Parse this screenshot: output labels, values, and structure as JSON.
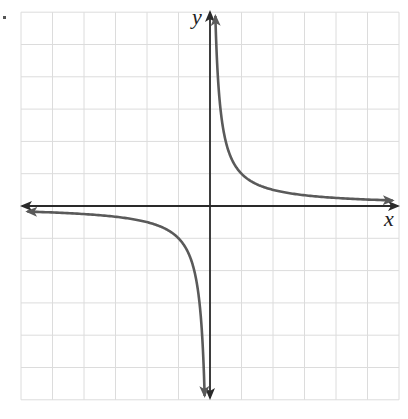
{
  "chart_data": {
    "type": "line",
    "title": "",
    "xlabel": "x",
    "ylabel": "y",
    "xlim": [
      -6,
      6
    ],
    "ylim": [
      -6,
      6
    ],
    "grid": true,
    "ticks_labeled": false,
    "legend": null,
    "series": [
      {
        "name": "y = k/x (k ≈ 1), first-quadrant branch",
        "equation": "y = 1/x",
        "x": [
          0.17,
          0.25,
          0.33,
          0.5,
          0.75,
          1,
          1.5,
          2,
          3,
          4,
          5,
          5.8
        ],
        "y": [
          5.8,
          4,
          3,
          2,
          1.33,
          1,
          0.67,
          0.5,
          0.33,
          0.25,
          0.2,
          0.17
        ]
      },
      {
        "name": "y = k/x (k ≈ 1), third-quadrant branch",
        "equation": "y = 1/x",
        "x": [
          -5.8,
          -5,
          -4,
          -3,
          -2,
          -1.5,
          -1,
          -0.75,
          -0.5,
          -0.33,
          -0.25,
          -0.17
        ],
        "y": [
          -0.17,
          -0.2,
          -0.25,
          -0.33,
          -0.5,
          -0.67,
          -1,
          -1.33,
          -2,
          -3,
          -4,
          -5.8
        ]
      }
    ],
    "asymptotes": {
      "vertical": "x = 0",
      "horizontal": "y = 0"
    },
    "colors": {
      "axis": "#2a2a2a",
      "curve": "#5a5a5a",
      "grid": "#dcdcdc",
      "background": "#ffffff"
    }
  },
  "labels": {
    "x_axis": "x",
    "y_axis": "y"
  }
}
